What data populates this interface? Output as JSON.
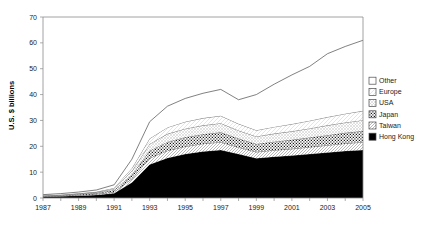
{
  "chart_data": {
    "type": "area",
    "stacked": true,
    "title": "",
    "subtitle": "",
    "xlabel": "",
    "ylabel": "U.S. $ billions",
    "ylim": [
      0,
      70
    ],
    "ytick_step": 10,
    "yticks": [
      "0",
      "10",
      "20",
      "30",
      "40",
      "50",
      "60",
      "70"
    ],
    "ytick_values": [
      0,
      10,
      20,
      30,
      40,
      50,
      60,
      70
    ],
    "xlim": [
      1987,
      2005
    ],
    "x": [
      1987,
      1988,
      1989,
      1990,
      1991,
      1992,
      1993,
      1994,
      1995,
      1996,
      1997,
      1998,
      1999,
      2000,
      2001,
      2002,
      2003,
      2004,
      2005
    ],
    "xticks": [
      1987,
      1988,
      1989,
      1990,
      1991,
      1992,
      1993,
      1994,
      1995,
      1996,
      1997,
      1998,
      1999,
      2000,
      2001,
      2002,
      2003,
      2004,
      2005
    ],
    "xtick_labels": [
      "1987",
      "",
      "1989",
      "",
      "1991",
      "",
      "1993",
      "",
      "1995",
      "",
      "1997",
      "",
      "1999",
      "",
      "2001",
      "",
      "2003",
      "",
      "2005"
    ],
    "grid": false,
    "legend_position": "right",
    "series": [
      {
        "name": "Hong Kong",
        "fill": "solid-black",
        "color": "#000000",
        "values": [
          0.5,
          0.7,
          0.9,
          1.2,
          1.8,
          6.0,
          13.0,
          15.5,
          17.0,
          18.0,
          18.6,
          17.0,
          15.4,
          16.0,
          16.4,
          17.0,
          17.6,
          18.2,
          18.6
        ]
      },
      {
        "name": "Taiwan",
        "fill": "diagonal-hatch",
        "color": "#d9d9d9",
        "values": [
          0.1,
          0.1,
          0.2,
          0.3,
          0.5,
          1.4,
          2.4,
          2.8,
          2.9,
          3.0,
          3.0,
          2.6,
          2.4,
          2.5,
          2.6,
          2.7,
          2.8,
          2.9,
          3.0
        ]
      },
      {
        "name": "Japan",
        "fill": "dotted-speckle",
        "color": "#ffffff",
        "values": [
          0.2,
          0.2,
          0.3,
          0.4,
          0.7,
          1.6,
          2.9,
          3.4,
          3.6,
          3.7,
          3.8,
          3.4,
          3.1,
          3.3,
          3.5,
          3.7,
          3.9,
          4.1,
          4.3
        ]
      },
      {
        "name": "USA",
        "fill": "light-grid",
        "color": "#efefef",
        "values": [
          0.1,
          0.2,
          0.2,
          0.3,
          0.5,
          1.4,
          2.6,
          3.1,
          3.3,
          3.4,
          3.5,
          3.1,
          2.9,
          3.1,
          3.3,
          3.5,
          3.8,
          4.0,
          4.2
        ]
      },
      {
        "name": "Europe",
        "fill": "light-hatch",
        "color": "#f4f4f4",
        "values": [
          0.1,
          0.1,
          0.2,
          0.2,
          0.4,
          1.1,
          2.1,
          2.5,
          2.7,
          2.8,
          2.9,
          2.6,
          2.4,
          2.6,
          2.8,
          3.0,
          3.2,
          3.4,
          3.6
        ]
      },
      {
        "name": "Other",
        "fill": "white",
        "color": "#ffffff",
        "values": [
          0.3,
          0.4,
          0.5,
          0.7,
          1.2,
          3.5,
          6.5,
          8.2,
          9.0,
          9.6,
          10.2,
          9.3,
          13.8,
          16.5,
          19.0,
          21.0,
          24.5,
          26.0,
          27.3
        ]
      }
    ],
    "totals": [
      1.3,
      1.7,
      2.3,
      3.1,
      5.1,
      15.0,
      29.5,
      35.5,
      38.5,
      40.5,
      42.0,
      38.0,
      40.0,
      44.0,
      47.6,
      50.9,
      55.8,
      58.6,
      61.0
    ]
  },
  "legend": {
    "entries": [
      {
        "label": "Other"
      },
      {
        "label": "Europe"
      },
      {
        "label": "USA"
      },
      {
        "label": "Japan"
      },
      {
        "label": "Taiwan"
      },
      {
        "label": "Hong Kong"
      }
    ]
  }
}
